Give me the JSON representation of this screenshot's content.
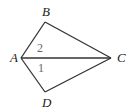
{
  "diagram": {
    "type": "geometry-figure",
    "vertices": [
      {
        "id": "A",
        "label": "A",
        "x": 21,
        "y": 58,
        "lx": 10,
        "ly": 62
      },
      {
        "id": "B",
        "label": "B",
        "x": 45,
        "y": 22,
        "lx": 42,
        "ly": 16
      },
      {
        "id": "C",
        "label": "C",
        "x": 111,
        "y": 58,
        "lx": 117,
        "ly": 62
      },
      {
        "id": "D",
        "label": "D",
        "x": 45,
        "y": 92,
        "lx": 42,
        "ly": 107
      }
    ],
    "edges": [
      [
        "A",
        "B"
      ],
      [
        "B",
        "C"
      ],
      [
        "A",
        "C"
      ],
      [
        "A",
        "D"
      ],
      [
        "D",
        "C"
      ]
    ],
    "angle_labels": [
      {
        "label": "2",
        "x": 37,
        "y": 52
      },
      {
        "label": "1",
        "x": 38,
        "y": 72
      }
    ]
  }
}
